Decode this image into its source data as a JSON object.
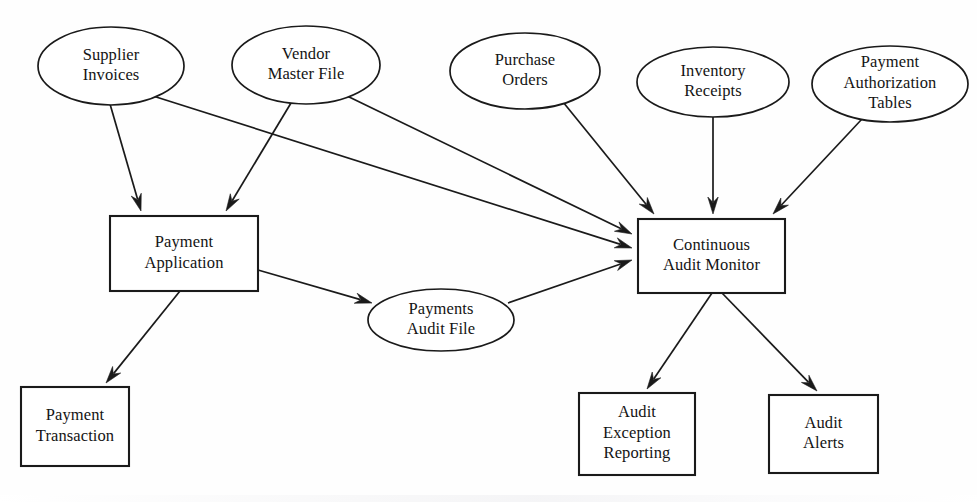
{
  "diagram": {
    "type": "data-flow-diagram",
    "background_color": "#fefefe",
    "stroke_color": "#1a1a1a",
    "nodes": [
      {
        "id": "supplier-invoices",
        "shape": "ellipse",
        "lines": [
          "Supplier",
          "Invoices"
        ],
        "cx": 111,
        "cy": 66,
        "rx": 73,
        "ry": 39
      },
      {
        "id": "vendor-master-file",
        "shape": "ellipse",
        "lines": [
          "Vendor",
          "Master File"
        ],
        "cx": 306,
        "cy": 65,
        "rx": 74,
        "ry": 39
      },
      {
        "id": "purchase-orders",
        "shape": "ellipse",
        "lines": [
          "Purchase",
          "Orders"
        ],
        "cx": 525,
        "cy": 71,
        "rx": 75,
        "ry": 38
      },
      {
        "id": "inventory-receipts",
        "shape": "ellipse",
        "lines": [
          "Inventory",
          "Receipts"
        ],
        "cx": 713,
        "cy": 82,
        "rx": 76,
        "ry": 35
      },
      {
        "id": "payment-authorization-tables",
        "shape": "ellipse",
        "lines": [
          "Payment",
          "Authorization",
          "Tables"
        ],
        "cx": 890,
        "cy": 84,
        "rx": 78,
        "ry": 38
      },
      {
        "id": "payment-application",
        "shape": "rect",
        "lines": [
          "Payment",
          "Application"
        ],
        "x": 110,
        "y": 216,
        "w": 148,
        "h": 75
      },
      {
        "id": "payments-audit-file",
        "shape": "ellipse",
        "lines": [
          "Payments",
          "Audit File"
        ],
        "cx": 441,
        "cy": 320,
        "rx": 73,
        "ry": 31
      },
      {
        "id": "continuous-audit-monitor",
        "shape": "rect",
        "lines": [
          "Continuous",
          "Audit Monitor"
        ],
        "x": 638,
        "y": 219,
        "w": 147,
        "h": 74
      },
      {
        "id": "payment-transaction",
        "shape": "rect",
        "lines": [
          "Payment",
          "Transaction"
        ],
        "x": 21,
        "y": 387,
        "w": 108,
        "h": 79
      },
      {
        "id": "audit-exception-reporting",
        "shape": "rect",
        "lines": [
          "Audit",
          "Exception",
          "Reporting"
        ],
        "x": 579,
        "y": 393,
        "w": 116,
        "h": 82
      },
      {
        "id": "audit-alerts",
        "shape": "rect",
        "lines": [
          "Audit",
          "Alerts"
        ],
        "x": 769,
        "y": 395,
        "w": 109,
        "h": 78
      }
    ],
    "edges": [
      {
        "id": "supplier-invoices-to-payment-application",
        "from": "supplier-invoices",
        "to": "payment-application",
        "x1": 110,
        "y1": 104,
        "x2": 141,
        "y2": 211
      },
      {
        "id": "supplier-invoices-to-continuous-audit-monitor",
        "from": "supplier-invoices",
        "to": "continuous-audit-monitor",
        "x1": 153,
        "y1": 96,
        "x2": 632,
        "y2": 248
      },
      {
        "id": "vendor-master-file-to-payment-application",
        "from": "vendor-master-file",
        "to": "payment-application",
        "x1": 291,
        "y1": 103,
        "x2": 226,
        "y2": 211
      },
      {
        "id": "vendor-master-file-to-continuous-audit-monitor",
        "from": "vendor-master-file",
        "to": "continuous-audit-monitor",
        "x1": 345,
        "y1": 95,
        "x2": 632,
        "y2": 234
      },
      {
        "id": "purchase-orders-to-continuous-audit-monitor",
        "from": "purchase-orders",
        "to": "continuous-audit-monitor",
        "x1": 563,
        "y1": 102,
        "x2": 654,
        "y2": 214
      },
      {
        "id": "inventory-receipts-to-continuous-audit-monitor",
        "from": "inventory-receipts",
        "to": "continuous-audit-monitor",
        "x1": 713,
        "y1": 117,
        "x2": 713,
        "y2": 214
      },
      {
        "id": "payment-authorization-tables-to-continuous-audit-monitor",
        "from": "payment-authorization-tables",
        "to": "continuous-audit-monitor",
        "x1": 862,
        "y1": 119,
        "x2": 773,
        "y2": 214
      },
      {
        "id": "payment-application-to-payments-audit-file",
        "from": "payment-application",
        "to": "payments-audit-file",
        "x1": 258,
        "y1": 270,
        "x2": 372,
        "y2": 303
      },
      {
        "id": "payment-application-to-payment-transaction",
        "from": "payment-application",
        "to": "payment-transaction",
        "x1": 180,
        "y1": 291,
        "x2": 106,
        "y2": 383
      },
      {
        "id": "payments-audit-file-to-continuous-audit-monitor",
        "from": "payments-audit-file",
        "to": "continuous-audit-monitor",
        "x1": 508,
        "y1": 303,
        "x2": 632,
        "y2": 260
      },
      {
        "id": "continuous-audit-monitor-to-audit-exception-reporting",
        "from": "continuous-audit-monitor",
        "to": "audit-exception-reporting",
        "x1": 712,
        "y1": 293,
        "x2": 647,
        "y2": 389
      },
      {
        "id": "continuous-audit-monitor-to-audit-alerts",
        "from": "continuous-audit-monitor",
        "to": "audit-alerts",
        "x1": 722,
        "y1": 293,
        "x2": 817,
        "y2": 391
      }
    ]
  }
}
